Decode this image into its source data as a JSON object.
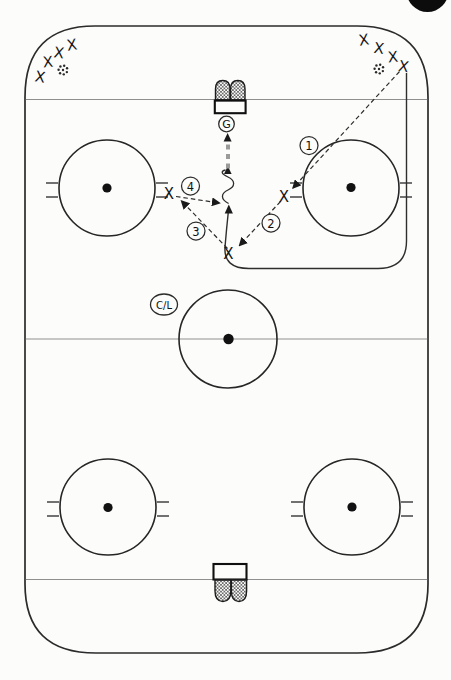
{
  "colors": {
    "paper": "#fcfcfb",
    "board_line": "#2b2b2b",
    "thin_line": "#8f8f8f",
    "marks": "#161616",
    "shot_gray": "#9b9b9b",
    "badge": "#0c0c0c"
  },
  "labels": {
    "goalie": "G",
    "center_line": "C/L",
    "player": "X"
  },
  "sequence_labels": [
    {
      "label": "1",
      "x": 309,
      "y": 145.5
    },
    {
      "label": "2",
      "x": 271,
      "y": 223
    },
    {
      "label": "3",
      "x": 196,
      "y": 231
    },
    {
      "label": "4",
      "x": 190.5,
      "y": 186
    }
  ],
  "players": {
    "corner_group_left": [
      [
        72,
        45
      ],
      [
        59,
        53
      ],
      [
        48,
        62
      ],
      [
        40,
        77
      ]
    ],
    "corner_group_right": [
      [
        364,
        40
      ],
      [
        379,
        48.5
      ],
      [
        393,
        57
      ],
      [
        403.5,
        66.5
      ]
    ],
    "drill_positions": [
      [
        169,
        194
      ],
      [
        284,
        197
      ],
      [
        228.5,
        253.5
      ]
    ]
  },
  "pucks": [
    [
      63,
      70
    ],
    [
      379,
      69
    ]
  ]
}
